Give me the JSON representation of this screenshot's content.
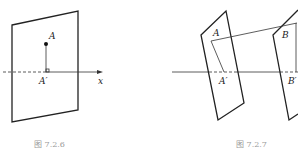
{
  "figures": [
    {
      "id": "fig-7-2-6",
      "caption": "图 7.2.6",
      "labels": {
        "point": "A",
        "projection": "A′",
        "axis": "x"
      }
    },
    {
      "id": "fig-7-2-7",
      "caption": "图 7.2.7",
      "labels": {
        "point_a": "A",
        "projection_a": "A′",
        "point_b": "B",
        "projection_b": "B′"
      }
    }
  ],
  "colors": {
    "line": "#222222",
    "caption": "#999999",
    "background": "#ffffff"
  }
}
